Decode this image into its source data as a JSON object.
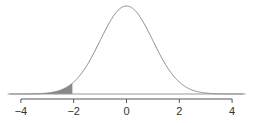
{
  "chart_data": {
    "type": "area",
    "title": "",
    "xlabel": "",
    "ylabel": "",
    "distribution": {
      "name": "normal",
      "mean": 0,
      "sd": 1
    },
    "shaded_region": {
      "from": -4.5,
      "to": -2.05,
      "color": "#888888"
    },
    "xlim": [
      -4.5,
      4.5
    ],
    "x_ticks": [
      -4,
      -2,
      0,
      2,
      4
    ],
    "x_tick_labels": [
      "-4",
      "-2",
      "0",
      "2",
      "4"
    ],
    "grid": false,
    "legend": null,
    "colors": {
      "curve": "#888888",
      "baseline": "#888888",
      "fill": "#888888",
      "axis": "#555555"
    }
  }
}
